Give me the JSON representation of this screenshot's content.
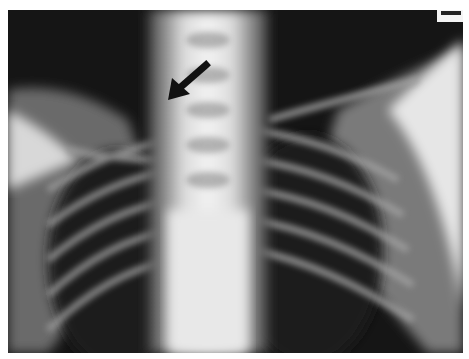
{
  "image": {
    "subject": "chest radiograph (frontal view)",
    "annotation": {
      "type": "arrow",
      "color": "#111111",
      "direction": "pointing down-left",
      "target": "upper thoracic vertebral region"
    }
  }
}
